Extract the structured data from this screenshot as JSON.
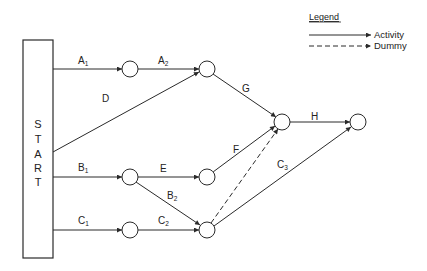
{
  "start_box": {
    "letters": [
      "S",
      "T",
      "A",
      "R",
      "T"
    ],
    "x": 23,
    "y": 40,
    "w": 30,
    "h": 218
  },
  "legend": {
    "title": "Legend",
    "items": [
      {
        "label": "Activity",
        "style": "solid"
      },
      {
        "label": "Dummy",
        "style": "dashed"
      }
    ]
  },
  "nodes": [
    {
      "id": "n1",
      "x": 130,
      "y": 69
    },
    {
      "id": "n2",
      "x": 207,
      "y": 69
    },
    {
      "id": "n3",
      "x": 130,
      "y": 177
    },
    {
      "id": "n4",
      "x": 207,
      "y": 177
    },
    {
      "id": "n5",
      "x": 130,
      "y": 230
    },
    {
      "id": "n6",
      "x": 207,
      "y": 230
    },
    {
      "id": "n7",
      "x": 282,
      "y": 122
    },
    {
      "id": "n8",
      "x": 358,
      "y": 122
    }
  ],
  "activities": [
    {
      "name": "A",
      "sub": "1",
      "from": "start",
      "to": "n1",
      "type": "activity"
    },
    {
      "name": "A",
      "sub": "2",
      "from": "n1",
      "to": "n2",
      "type": "activity"
    },
    {
      "name": "D",
      "sub": "",
      "from": "start",
      "to": "n2",
      "type": "activity"
    },
    {
      "name": "G",
      "sub": "",
      "from": "n2",
      "to": "n7",
      "type": "activity"
    },
    {
      "name": "B",
      "sub": "1",
      "from": "start",
      "to": "n3",
      "type": "activity"
    },
    {
      "name": "E",
      "sub": "",
      "from": "n3",
      "to": "n4",
      "type": "activity"
    },
    {
      "name": "F",
      "sub": "",
      "from": "n4",
      "to": "n7",
      "type": "activity"
    },
    {
      "name": "B",
      "sub": "2",
      "from": "n3",
      "to": "n6",
      "type": "activity"
    },
    {
      "name": "C",
      "sub": "1",
      "from": "start",
      "to": "n5",
      "type": "activity"
    },
    {
      "name": "C",
      "sub": "2",
      "from": "n5",
      "to": "n6",
      "type": "activity"
    },
    {
      "name": "",
      "sub": "",
      "from": "n6",
      "to": "n7",
      "type": "dummy"
    },
    {
      "name": "C",
      "sub": "3",
      "from": "n6",
      "to": "n8",
      "type": "activity"
    },
    {
      "name": "H",
      "sub": "",
      "from": "n7",
      "to": "n8",
      "type": "activity"
    }
  ],
  "labels": {
    "A1": {
      "main": "A",
      "sub": "1"
    },
    "A2": {
      "main": "A",
      "sub": "2"
    },
    "D": {
      "main": "D"
    },
    "G": {
      "main": "G"
    },
    "H": {
      "main": "H"
    },
    "B1": {
      "main": "B",
      "sub": "1"
    },
    "E": {
      "main": "E"
    },
    "F": {
      "main": "F"
    },
    "B2": {
      "main": "B",
      "sub": "2"
    },
    "C1": {
      "main": "C",
      "sub": "1"
    },
    "C2": {
      "main": "C",
      "sub": "2"
    },
    "C3": {
      "main": "C",
      "sub": "3"
    }
  },
  "colors": {
    "line": "#2a2a2a",
    "background": "#ffffff"
  }
}
